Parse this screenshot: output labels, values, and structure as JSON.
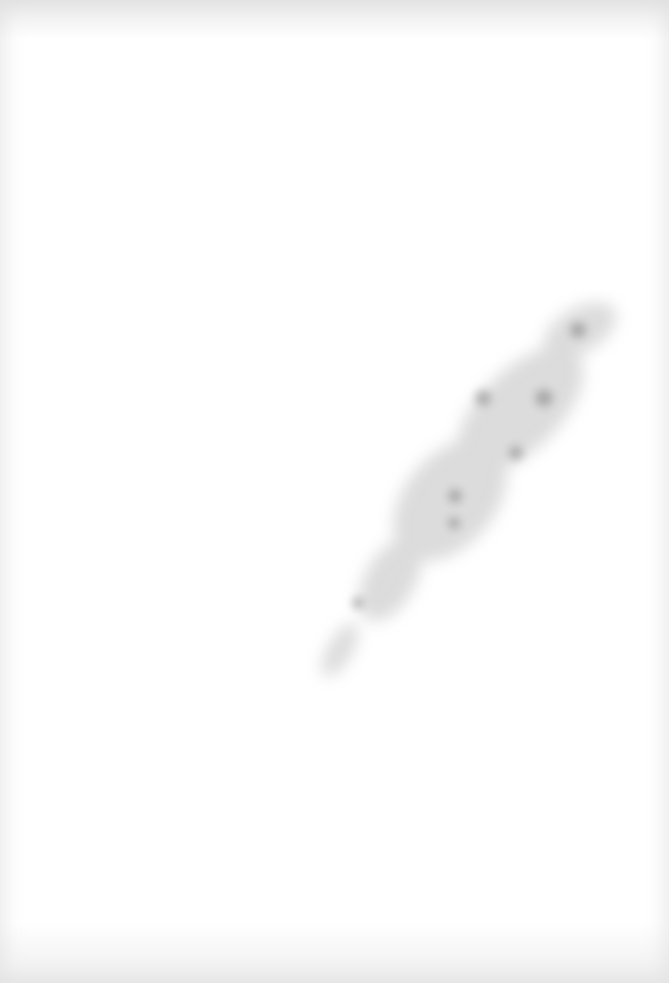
{
  "document": {
    "type": "scanned-page",
    "text": "",
    "background_color": "#ffffff",
    "marks": [
      {
        "kind": "smudge",
        "color": "#8a8a8a",
        "orientation": "diagonal, lower-left to upper-right"
      }
    ]
  }
}
